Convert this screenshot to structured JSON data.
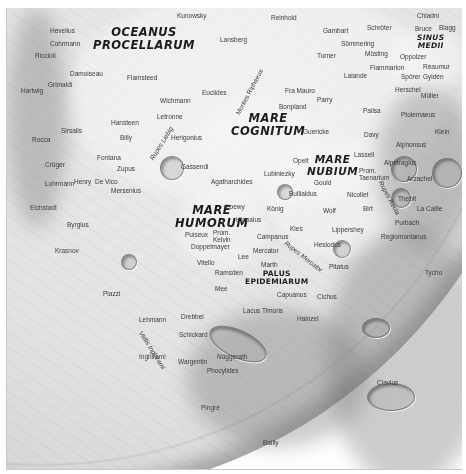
{
  "map": {
    "title": "Lunar near side — southwest quadrant",
    "colors": {
      "background": "#ffffff",
      "frame_border": "#c8c8c8",
      "maria": "#e6e6e6",
      "highlands": "#a8a8a8",
      "label_text": "#3a3a3a",
      "major_label_text": "#1c1c1c"
    }
  },
  "major_features": [
    {
      "id": "oceanus",
      "line1": "OCEANUS",
      "line2": "PROCELLARUM"
    },
    {
      "id": "cognitum",
      "line1": "MARE",
      "line2": "COGNITUM"
    },
    {
      "id": "nubium",
      "line1": "MARE",
      "line2": "NUBIUM"
    },
    {
      "id": "humorum",
      "line1": "MARE",
      "line2": "HUMORUM"
    },
    {
      "id": "sinus_medii",
      "line1": "SINUS",
      "line2": "MEDII"
    },
    {
      "id": "palus",
      "line1": "PALUS",
      "line2": "EPIDEMIARUM"
    }
  ],
  "labels": {
    "hevelius": "Hevelius",
    "cavalerius": "Cohrmann",
    "riccioli": "Riccioli",
    "damoiseau": "Damoiseau",
    "grimaldi": "Grimaldi",
    "hartwig": "Hartwig",
    "flamsteed": "Flamsteed",
    "kunowsky": "Kunowsky",
    "reinhold": "Reinhold",
    "lansberg": "Lansberg",
    "euclides": "Euclides",
    "montes_riphaeus": "Montes Riphaeus",
    "wichmann": "Wichmann",
    "letronne": "Letronne",
    "fra_mauro": "Fra Mauro",
    "bonpland": "Bonpland",
    "parry": "Parry",
    "chladni": "Chladni",
    "gambart": "Gambart",
    "schroter": "Schröter",
    "bruce": "Bruce",
    "blagg": "Blagg",
    "sommering": "Sömmering",
    "mosting": "Mösting",
    "turner": "Turner",
    "oppolzer": "Oppolzer",
    "flammarion": "Flammarion",
    "reaumur": "Réaumur",
    "lalande": "Lalande",
    "spörer": "Spörer",
    "gyldén": "Gyldén",
    "herschel": "Herschel",
    "muller": "Müller",
    "palisa": "Palisa",
    "ptolemaeus": "Ptolemaeus",
    "guericke": "Guericke",
    "davy": "Davy",
    "klein": "Klein",
    "alphonsus": "Alphonsus",
    "lassell": "Lassell",
    "alpetragius": "Alpetragius",
    "arzachel": "Arzachel",
    "pitatus_taenarium": "Prom. Taenarium",
    "rupes_recta": "Rupes Recta",
    "thebit": "Thebit",
    "la_caille": "La Caille",
    "hansteen": "Hansteen",
    "billy": "Billy",
    "sirsalis": "Sirsalis",
    "rocca": "Rocca",
    "fontana": "Fontana",
    "zupus": "Zupus",
    "cruger": "Crüger",
    "mersenius": "Mersenius",
    "de_vico": "De Vico",
    "lohrmann": "Lohrmann",
    "henry": "Henry",
    "byrgius": "Byrgius",
    "eichstadt": "Eichstadt",
    "krasnov": "Krasnov",
    "herigonius": "Herigonius",
    "gassendi": "Gassendi",
    "agatharchides": "Agatharchides",
    "opelt": "Opelt",
    "lubiniezky": "Lubiniezky",
    "gould": "Gould",
    "bullialdus": "Bullialdus",
    "nicollet": "Nicollet",
    "birt": "Birt",
    "konig": "König",
    "wolf": "Wolf",
    "kies": "Kies",
    "lippershey": "Lippershey",
    "loewy": "Loewy",
    "hippalus": "Hippalus",
    "campanus": "Campanus",
    "mercator": "Mercator",
    "rupes_mercator": "Rupes Mercator",
    "hesiodus": "Hesiodus",
    "pitatus": "Pitatus",
    "purbach": "Purbach",
    "regiomontanus": "Regiomontanus",
    "rupes_liebig": "Rupes Liebig",
    "puiseux": "Puiseux",
    "prom_kelvin": "Prom. Kelvin",
    "doppelmayer": "Doppelmayer",
    "vitello": "Vitello",
    "lee": "Lee",
    "ramsden": "Ramsden",
    "marth": "Marth",
    "capuanus": "Capuanus",
    "cichus": "Cichus",
    "lacus_timoris": "Lacus Timoris",
    "mee": "Mee",
    "hainzel": "Hainzel",
    "schickard": "Schickard",
    "drebbel": "Drebbel",
    "inghirami": "Inghirami",
    "vallis_inghirami": "Vallis Inghirami",
    "wargentin": "Wargentin",
    "noggerath": "Nöggerath",
    "phocylides": "Phocylides",
    "lehmann": "Lehmann",
    "piazzi": "Piazzi",
    "pingre": "Pingré",
    "bailly": "Bailly",
    "clavius": "Clavius",
    "tycho": "Tycho"
  }
}
